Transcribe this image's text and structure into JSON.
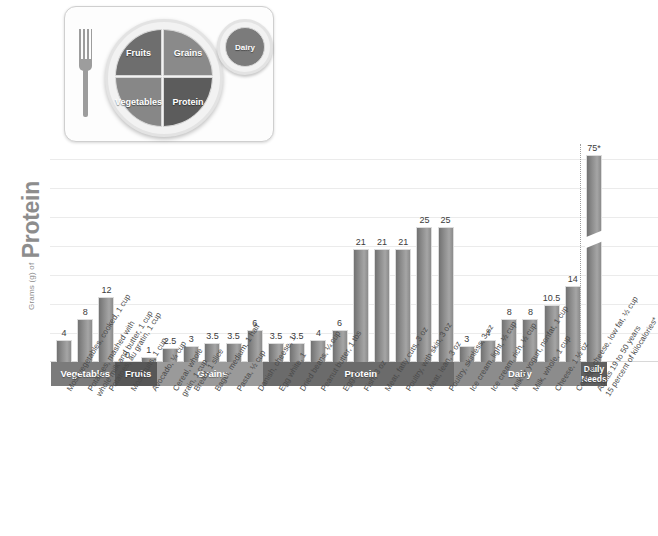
{
  "myplate": {
    "title": "MyPlate icon",
    "segments": [
      {
        "name": "Fruits",
        "label": "Fruits"
      },
      {
        "name": "Grains",
        "label": "Grains"
      },
      {
        "name": "Vegetables",
        "label": "Vegetables"
      },
      {
        "name": "Protein",
        "label": "Protein"
      },
      {
        "name": "Dairy",
        "label": "Dairy"
      }
    ]
  },
  "axis": {
    "y_title_small": "Grams (g) of",
    "y_title_big": "Protein"
  },
  "chart_data": {
    "type": "bar",
    "title": "Grams (g) of Protein",
    "xlabel": "",
    "ylabel": "Grams (g) of Protein",
    "ylim": [
      0,
      30
    ],
    "grid": true,
    "legend": "none",
    "axis_break": true,
    "note": "Daily Needs bar is drawn with an axis break; its true value is 75 g.",
    "categories": [
      "Most vegetables, cooked, 1 cup",
      "Potatoes, mashed with whole milk and butter, 1 cup",
      "Potatoes, au gratin, 1 cup",
      "Most fruits, 1 cup",
      "Avocado, 1/4 cup",
      "Cereal, whole grain, 1 cup",
      "Bread, 1 slice",
      "Bagel, medium, 1 half",
      "Pasta, 1/2 cup",
      "Danish, cheese, 1",
      "Egg white, 1",
      "Dried beans, 1/4 cup",
      "Peanut butter, 1 tbs",
      "Egg, 1",
      "Fish, 3 oz",
      "Meat, fatty cuts, 3 oz",
      "Poultry, with skin, 3 oz",
      "Meat, lean, 3 oz",
      "Poultry, skinless, 3 oz",
      "Ice cream, light, 1/2 cup",
      "Ice cream, rich, 1/2 cup",
      "Milk or yogurt, nonfat, 1 cup",
      "Milk, whole, 1 cup",
      "Cheese, 1 1/2 oz",
      "Cottage cheese, low fat, 1/2 cup",
      "Adults 19 to 50 years 15 percent of kilocalories*"
    ],
    "values": [
      4,
      8,
      12,
      0,
      1,
      2.5,
      3,
      3.5,
      3.5,
      6,
      3.5,
      3.5,
      4,
      6,
      21,
      21,
      21,
      25,
      25,
      3,
      4,
      8,
      8,
      10.5,
      14,
      75
    ],
    "value_labels": [
      "4",
      "8",
      "12",
      "0",
      "1",
      "2.5",
      "3",
      "3.5",
      "3.5",
      "6",
      "3.5",
      "3.5",
      "4",
      "6",
      "21",
      "21",
      "21",
      "25",
      "25",
      "3",
      "4",
      "8",
      "8",
      "10.5",
      "14",
      "75*"
    ],
    "groups": [
      {
        "label": "Vegetables",
        "count": 3,
        "color": "#7b7b7b"
      },
      {
        "label": "Fruits",
        "count": 2,
        "color": "#575757"
      },
      {
        "label": "Grains",
        "count": 5,
        "color": "#9a9a9a"
      },
      {
        "label": "Protein",
        "count": 9,
        "color": "#6b6b6b"
      },
      {
        "label": "Dairy",
        "count": 6,
        "color": "#8c8c8c"
      },
      {
        "label": "Daily Needs",
        "count": 1,
        "color": "#5f5f5f"
      }
    ]
  },
  "colors": {
    "bar_fill_dark": "#727272",
    "bar_fill_light": "#a5a5a5",
    "bar_border": "#dcdcdc",
    "grid": "#ebebeb",
    "axis_text": "#4a4a4a",
    "title_gray": "#8d8d8d",
    "card_bg": "#fdfdfd"
  }
}
